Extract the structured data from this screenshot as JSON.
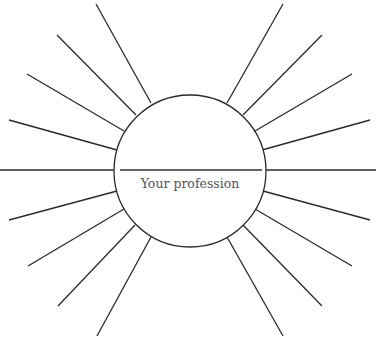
{
  "diagram": {
    "type": "sunburst-brainstorm",
    "center_label": "Your profession",
    "ray_count": 18,
    "line_color": "#2a2a2a",
    "text_color": "#555555"
  }
}
